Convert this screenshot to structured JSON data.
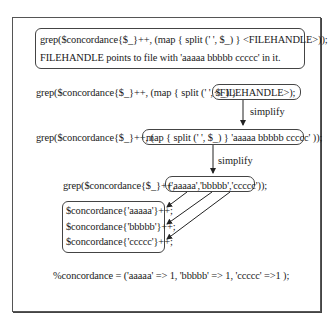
{
  "diagram": {
    "intro_box": {
      "line1": "grep($concordance{$_}++, (map { split (' ', $_) } <FILEHANDLE>));",
      "line2": "FILEHANDLE points to file with 'aaaaa bbbbb ccccc' in it."
    },
    "step1": {
      "prefix": "grep($concordance{$_}++, (map { split (' ', $_) } ",
      "highlight": "<FILEHANDLE>);"
    },
    "arrow1_label": "simplify",
    "step2": {
      "prefix": "grep($concordance{$_}++, (",
      "highlight": "map { split (' ', $_) } 'aaaaa bbbbb ccccc' ));"
    },
    "arrow2_label": "simplify",
    "step3": {
      "prefix": "grep($concordance{$_}++,",
      "highlight": "('aaaaa','bbbbb','ccccc'));"
    },
    "expansion": {
      "items": [
        "$concordance{'aaaaa'}++;",
        "$concordance{'bbbbb'}++;",
        "$concordance{'ccccc'}++;"
      ]
    },
    "result": "%concordance = ('aaaaa' => 1, 'bbbbb' => 1, 'ccccc' =>1 );"
  }
}
